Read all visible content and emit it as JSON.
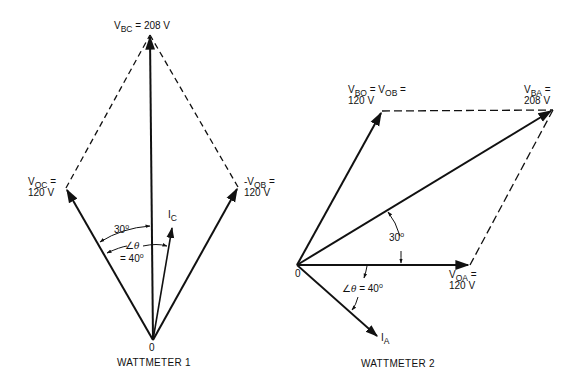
{
  "diagram_1": {
    "caption": "WATTMETER 1",
    "origin_label": "0",
    "labels": {
      "v_bc": {
        "main": "V",
        "sub": "BC",
        "rest": " = 208 V"
      },
      "v_oc": {
        "main": "V",
        "sub": "OC",
        "rest": " =",
        "line2": "120 V"
      },
      "neg_v_ob": {
        "main": "-V",
        "sub": "OB",
        "rest": " =",
        "line2": "120 V"
      },
      "i_c": {
        "main": "I",
        "sub": "C"
      }
    },
    "angles": {
      "alpha": {
        "value": "30",
        "unit": "o"
      },
      "theta": {
        "symbol": "∠",
        "var": "θ",
        "line2": "= 40",
        "unit": "o"
      }
    }
  },
  "diagram_2": {
    "caption": "WATTMETER 2",
    "origin_label": "0",
    "labels": {
      "v_bo": {
        "main1": "V",
        "sub1": "BO",
        "mid": " = V",
        "sub2": "OB",
        "rest": " =",
        "line2": "120 V"
      },
      "v_ba": {
        "main": "V",
        "sub": "BA",
        "rest": " =",
        "line2": "208 V"
      },
      "v_oa": {
        "main": "V",
        "sub": "OA",
        "rest": " =",
        "line2": "120 V"
      },
      "i_a": {
        "main": "I",
        "sub": "A"
      }
    },
    "angles": {
      "alpha": {
        "value": "30",
        "unit": "o"
      },
      "theta": {
        "symbol": "∠",
        "var": "θ",
        "rest": " = 40",
        "unit": "o"
      }
    }
  },
  "colors": {
    "line": "#111111",
    "background": "#ffffff"
  }
}
